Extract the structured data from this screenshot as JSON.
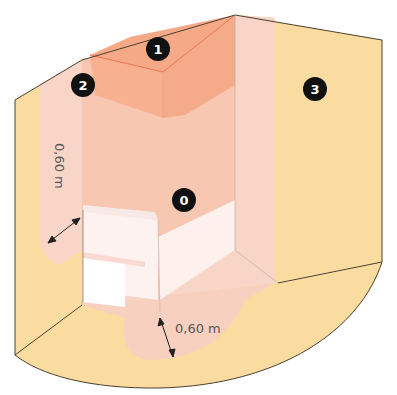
{
  "diagram": {
    "colors": {
      "background": "#ffffff",
      "zone3": "#fbdca0",
      "zone2": "#f9d5c8",
      "zone1": "#f7b597",
      "zone1_top": "#f6a987",
      "zone0_bath": "#fdf0ee",
      "bath_front": "#ffffff",
      "outline": "#4a4030",
      "badge": "#111111",
      "badge_text": "#ffffff",
      "dim_text": "#555555"
    },
    "zones": [
      {
        "id": "zone-0",
        "label": "0"
      },
      {
        "id": "zone-1",
        "label": "1"
      },
      {
        "id": "zone-2",
        "label": "2"
      },
      {
        "id": "zone-3",
        "label": "3"
      }
    ],
    "dimensions": [
      {
        "id": "dim-wall",
        "label": "0,60 m",
        "orientation": "vertical"
      },
      {
        "id": "dim-floor",
        "label": "0,60 m",
        "orientation": "horizontal"
      }
    ]
  }
}
